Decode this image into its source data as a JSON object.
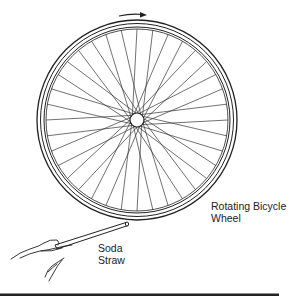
{
  "figure": {
    "labels": {
      "wheel": {
        "line1": "Rotating Bicycle",
        "line2": "Wheel"
      },
      "straw": {
        "line1": "Soda",
        "line2": "Straw"
      }
    },
    "wheel": {
      "cx": 137,
      "cy": 120,
      "outer_radius": 100,
      "tire_inner_radius": 97,
      "rim_outer_radius": 93,
      "rim_inner_radius": 91,
      "hub_radius": 7,
      "spoke_count": 36
    },
    "rotation_arrow": {
      "direction": "clockwise"
    },
    "colors": {
      "line": "#222222",
      "background": "#ffffff"
    }
  }
}
